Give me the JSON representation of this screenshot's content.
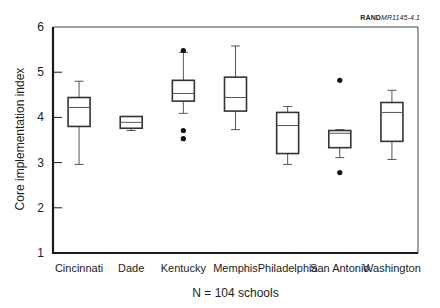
{
  "chart_data": {
    "type": "boxplot",
    "title": "",
    "figure_ref_bold": "RAND",
    "figure_ref_italic": "MR1145-4.1",
    "xlabel": "N = 104 schools",
    "ylabel": "Core implementation index",
    "ylim": [
      1,
      6
    ],
    "yticks": [
      "1",
      "2",
      "3",
      "4",
      "5",
      "6"
    ],
    "grid": false,
    "categories": [
      "Cincinnati",
      "Dade",
      "Kentucky",
      "Memphis",
      "Philadelphia",
      "San Antonio",
      "Washington"
    ],
    "series": [
      {
        "name": "Cincinnati",
        "whisker_low": 2.96,
        "q1": 3.8,
        "median": 4.22,
        "q3": 4.44,
        "whisker_high": 4.8,
        "outliers": []
      },
      {
        "name": "Dade",
        "whisker_low": 3.71,
        "q1": 3.76,
        "median": 3.89,
        "q3": 4.02,
        "whisker_high": 4.02,
        "outliers": []
      },
      {
        "name": "Kentucky",
        "whisker_low": 4.09,
        "q1": 4.36,
        "median": 4.53,
        "q3": 4.82,
        "whisker_high": 5.44,
        "outliers": [
          5.48,
          3.71,
          3.53
        ]
      },
      {
        "name": "Memphis",
        "whisker_low": 3.73,
        "q1": 4.14,
        "median": 4.44,
        "q3": 4.89,
        "whisker_high": 5.58,
        "outliers": []
      },
      {
        "name": "Philadelphia",
        "whisker_low": 2.96,
        "q1": 3.2,
        "median": 3.82,
        "q3": 4.11,
        "whisker_high": 4.24,
        "outliers": []
      },
      {
        "name": "San Antonio",
        "whisker_low": 3.11,
        "q1": 3.33,
        "median": 3.65,
        "q3": 3.71,
        "whisker_high": 3.73,
        "outliers": [
          4.82,
          2.78
        ]
      },
      {
        "name": "Washington",
        "whisker_low": 3.07,
        "q1": 3.47,
        "median": 4.11,
        "q3": 4.33,
        "whisker_high": 4.6,
        "outliers": []
      }
    ]
  },
  "colors": {
    "axis": "#1a1a1a",
    "box": "#333333",
    "whisker": "#555555",
    "outlier": "#111111",
    "frame": "#444444"
  }
}
